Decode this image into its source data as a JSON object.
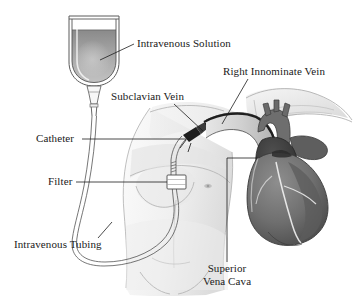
{
  "figure": {
    "background_color": "#ffffff",
    "width": 355,
    "height": 301,
    "style": "grayscale medical line illustration"
  },
  "labels": [
    {
      "id": "intravenous-solution",
      "text": "Intravenous Solution",
      "x": 137,
      "y": 47,
      "anchor": "start",
      "points_to": "iv-bag-fluid"
    },
    {
      "id": "right-innominate-vein",
      "text": "Right Innominate Vein",
      "x": 223,
      "y": 75,
      "anchor": "start",
      "points_to": "innominate-vein"
    },
    {
      "id": "subclavian-vein",
      "text": "Subclavian Vein",
      "x": 111,
      "y": 100,
      "anchor": "start",
      "points_to": "subclavian-vein-site"
    },
    {
      "id": "catheter",
      "text": "Catheter",
      "x": 36,
      "y": 142,
      "anchor": "start",
      "points_to": "catheter-line"
    },
    {
      "id": "filter",
      "text": "Filter",
      "x": 48,
      "y": 185,
      "anchor": "start",
      "points_to": "filter-box"
    },
    {
      "id": "intravenous-tubing",
      "text": "Intravenous Tubing",
      "x": 14,
      "y": 248,
      "anchor": "start",
      "points_to": "tubing-loop"
    },
    {
      "id": "superior-vena-cava-line1",
      "text": "Superior",
      "x": 227,
      "y": 272,
      "anchor": "middle",
      "points_to": "superior-vena-cava"
    },
    {
      "id": "superior-vena-cava-line2",
      "text": "Vena Cava",
      "x": 227,
      "y": 285,
      "anchor": "middle",
      "points_to": "superior-vena-cava"
    }
  ],
  "colors": {
    "fluid_top": "#8d8d8d",
    "fluid_bottom": "#b9b9b9",
    "bag_air": "#fcfcfc",
    "bag_outline": "#555555",
    "heart_body": "#7a7a7a",
    "heart_dark": "#3c3c3c",
    "heart_mid": "#6b6b6b",
    "vessel_light": "#cfcfcf",
    "body_skin": "#f2f2f2",
    "body_shade": "#d8d8d8",
    "bone": "#e2e2e2",
    "leader": "#1d1d1d",
    "text": "#1a1a1a"
  },
  "components": {
    "iv_bag": {
      "name": "iv-solution-bag",
      "x": 68,
      "y": 14,
      "width": 52,
      "height": 70
    },
    "drip_chamber": {
      "name": "drip-chamber",
      "x": 86,
      "y": 84,
      "width": 16,
      "height": 20
    },
    "filter_box": {
      "name": "inline-filter",
      "x": 168,
      "y": 176,
      "width": 18,
      "height": 14
    },
    "heart": {
      "name": "heart",
      "x": 250,
      "y": 120,
      "width": 85,
      "height": 105
    },
    "torso": {
      "name": "patient-torso",
      "x": 100,
      "y": 105,
      "width": 130,
      "height": 190
    }
  }
}
